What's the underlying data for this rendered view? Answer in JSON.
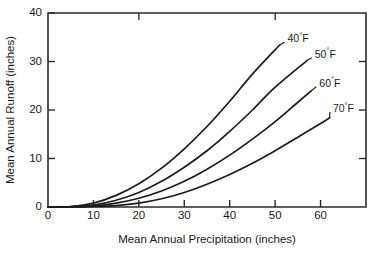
{
  "chart_data": {
    "type": "line",
    "title": "",
    "xlabel": "Mean Annual Precipitation (inches)",
    "ylabel": "Mean Annual Runoff (inches)",
    "xlim": [
      0,
      70
    ],
    "ylim": [
      0,
      40
    ],
    "xticks": [
      0,
      10,
      20,
      30,
      40,
      50,
      60
    ],
    "yticks": [
      0,
      10,
      20,
      30,
      40
    ],
    "xtick_labels": [
      "0",
      "10",
      "20",
      "30",
      "40",
      "50",
      "60"
    ],
    "ytick_labels": [
      "0",
      "10",
      "20",
      "30",
      "40"
    ],
    "grid": false,
    "legend_position": "inline-end-of-curve",
    "x": [
      0,
      5,
      10,
      15,
      20,
      25,
      30,
      35,
      40,
      45,
      50,
      55,
      60,
      65
    ],
    "series": [
      {
        "name": "40°F",
        "label_value": "40",
        "label_unit": "F",
        "label_degree": "°",
        "color": "#1c1c1c",
        "x": [
          0,
          5,
          10,
          15,
          20,
          25,
          30,
          35,
          40,
          45,
          51
        ],
        "values": [
          0,
          0.1,
          0.8,
          2.4,
          4.8,
          8.0,
          12.0,
          16.6,
          21.8,
          27.4,
          33.4
        ],
        "label_x": 52.5,
        "label_y": 34.6
      },
      {
        "name": "50°F",
        "label_value": "50",
        "label_unit": "F",
        "label_degree": "°",
        "color": "#1c1c1c",
        "x": [
          0,
          5,
          10,
          15,
          20,
          25,
          30,
          35,
          40,
          45,
          50,
          57
        ],
        "values": [
          0,
          0.05,
          0.4,
          1.4,
          3.0,
          5.3,
          8.2,
          11.6,
          15.6,
          20.0,
          24.7,
          30.2
        ],
        "label_x": 58.5,
        "label_y": 31.4
      },
      {
        "name": "60°F",
        "label_value": "60",
        "label_unit": "F",
        "label_degree": "°",
        "color": "#1c1c1c",
        "x": [
          0,
          5,
          10,
          15,
          20,
          25,
          30,
          35,
          40,
          45,
          50,
          55,
          58
        ],
        "values": [
          0,
          0.02,
          0.2,
          0.8,
          1.8,
          3.3,
          5.3,
          7.8,
          10.7,
          14.0,
          17.6,
          21.6,
          24.0
        ],
        "label_x": 59.5,
        "label_y": 25.4
      },
      {
        "name": "70°F",
        "label_value": "70",
        "label_unit": "F",
        "label_degree": "°",
        "color": "#1c1c1c",
        "x": [
          0,
          10,
          15,
          20,
          25,
          30,
          35,
          40,
          45,
          50,
          55,
          60,
          62
        ],
        "values": [
          0,
          0.1,
          0.3,
          0.8,
          1.7,
          3.0,
          4.7,
          6.7,
          9.0,
          11.6,
          14.4,
          17.2,
          18.4
        ],
        "label_x": 62.5,
        "label_y": 20.2
      }
    ]
  },
  "figure": {
    "background_color": "#ffffff",
    "axis_color": "#2b2b2b",
    "curve_color": "#1c1c1c"
  }
}
